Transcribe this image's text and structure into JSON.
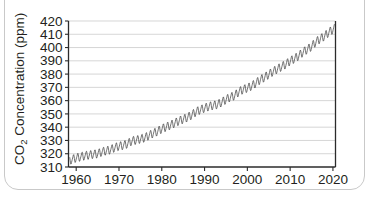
{
  "chart_data": {
    "type": "line",
    "title": "",
    "xlabel": "",
    "ylabel": "CO2 Concentration (ppm)",
    "ylabel_main": "CO",
    "ylabel_sub": "2",
    "ylabel_rest": " Concentration (ppm)",
    "grid": true,
    "legend": "none",
    "series_name": "Mauna Loa monthly mean CO2",
    "line_color": "#444444",
    "grid_color": "#c4c4c4",
    "axis_color": "#2b2b2b",
    "xlim": [
      1958.2,
      2020.6
    ],
    "ylim": [
      310,
      420
    ],
    "xticks": [
      1960,
      1970,
      1980,
      1990,
      2000,
      2010,
      2020
    ],
    "xtick_labels": [
      "1960",
      "1970",
      "1980",
      "1990",
      "2000",
      "2010",
      "2020"
    ],
    "yticks": [
      310,
      320,
      330,
      340,
      350,
      360,
      370,
      380,
      390,
      400,
      410,
      420
    ],
    "ytick_labels": [
      "310",
      "320",
      "330",
      "340",
      "350",
      "360",
      "370",
      "380",
      "390",
      "400",
      "410",
      "420"
    ],
    "seasonal_amplitude_ppm": 3.0,
    "seasonal_peak_month": 5,
    "annual_mean_x": [
      1958.5,
      1959,
      1960,
      1961,
      1962,
      1963,
      1964,
      1965,
      1966,
      1967,
      1968,
      1969,
      1970,
      1971,
      1972,
      1973,
      1974,
      1975,
      1976,
      1977,
      1978,
      1979,
      1980,
      1981,
      1982,
      1983,
      1984,
      1985,
      1986,
      1987,
      1988,
      1989,
      1990,
      1991,
      1992,
      1993,
      1994,
      1995,
      1996,
      1997,
      1998,
      1999,
      2000,
      2001,
      2002,
      2003,
      2004,
      2005,
      2006,
      2007,
      2008,
      2009,
      2010,
      2011,
      2012,
      2013,
      2014,
      2015,
      2016,
      2017,
      2018,
      2019,
      2020.4
    ],
    "annual_mean_y": [
      315.0,
      315.6,
      316.9,
      317.6,
      318.5,
      319.0,
      319.6,
      320.0,
      321.4,
      322.2,
      323.0,
      324.6,
      325.7,
      326.3,
      327.5,
      329.7,
      330.2,
      331.1,
      332.0,
      333.8,
      335.4,
      336.8,
      338.8,
      340.1,
      341.5,
      343.1,
      344.7,
      346.0,
      347.4,
      349.2,
      351.6,
      353.1,
      354.4,
      355.6,
      356.4,
      357.1,
      358.8,
      360.8,
      362.6,
      363.7,
      366.7,
      368.4,
      369.5,
      371.1,
      373.2,
      375.8,
      377.5,
      379.8,
      381.9,
      383.8,
      385.6,
      387.4,
      389.9,
      391.6,
      393.8,
      396.5,
      398.6,
      400.8,
      404.2,
      406.5,
      408.5,
      411.4,
      414.5
    ]
  }
}
